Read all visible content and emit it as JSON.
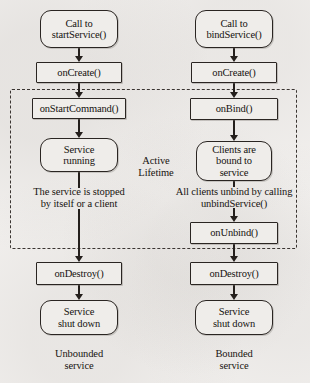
{
  "diagram": {
    "type": "flowchart",
    "background_color": "#f3f1ef",
    "stroke_color": "#2a2522",
    "node_fill_color": "#efedea",
    "region": {
      "label_line1": "Active",
      "label_line2": "Lifetime",
      "style": "dashed"
    },
    "columns": [
      {
        "name": "unbounded",
        "footer_line1": "Unbounded",
        "footer_line2": "service"
      },
      {
        "name": "bounded",
        "footer_line1": "Bounded",
        "footer_line2": "service"
      }
    ],
    "nodes": {
      "start_left_line1": "Call to",
      "start_left_line2": "startService()",
      "start_right_line1": "Call to",
      "start_right_line2": "bindService()",
      "on_create_left": "onCreate()",
      "on_create_right": "onCreate()",
      "on_start_command": "onStartCommand()",
      "on_bind": "onBind()",
      "service_running_line1": "Service",
      "service_running_line2": "running",
      "clients_bound_line1": "Clients are",
      "clients_bound_line2": "bound to",
      "clients_bound_line3": "service",
      "on_unbind": "onUnbind()",
      "on_destroy_left": "onDestroy()",
      "on_destroy_right": "onDestroy()",
      "shut_down_left_line1": "Service",
      "shut_down_left_line2": "shut down",
      "shut_down_right_line1": "Service",
      "shut_down_right_line2": "shut down"
    },
    "edge_labels": {
      "stopped_line1": "The service is stopped",
      "stopped_line2": "by itself or a client",
      "unbind_line1": "All clients unbind by calling",
      "unbind_line2": "unbindService()"
    }
  }
}
